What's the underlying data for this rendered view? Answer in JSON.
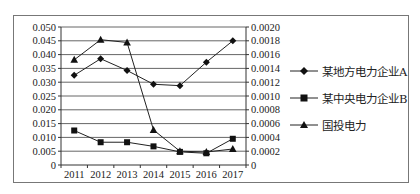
{
  "chart_data": {
    "type": "line",
    "title": "",
    "xlabel": "",
    "ylabel": "",
    "categories": [
      "2011",
      "2012",
      "2013",
      "2014",
      "2015",
      "2016",
      "2017"
    ],
    "left_axis": {
      "ylim": [
        0,
        0.05
      ],
      "ticks": [
        "0",
        "0.005",
        "0.010",
        "0.015",
        "0.020",
        "0.025",
        "0.030",
        "0.035",
        "0.040",
        "0.045",
        "0.050"
      ]
    },
    "right_axis": {
      "ylim": [
        0,
        0.002
      ],
      "ticks": [
        "0",
        "0.0002",
        "0.0004",
        "0.0006",
        "0.0008",
        "0.0010",
        "0.0012",
        "0.0014",
        "0.0016",
        "0.0018",
        "0.0020"
      ]
    },
    "grid": true,
    "legend_position": "right",
    "series": [
      {
        "name": "某地方电力企业A",
        "marker": "diamond",
        "axis": "right",
        "values": [
          0.0013,
          0.00154,
          0.00137,
          0.00117,
          0.00115,
          0.00149,
          0.0018
        ],
        "values_left_scale": [
          0.0323,
          0.0386,
          0.0343,
          0.0292,
          0.0287,
          0.0372,
          0.0449
        ]
      },
      {
        "name": "某中央电力企业B",
        "marker": "square",
        "axis": "right",
        "values": [
          0.0005,
          0.00033,
          0.00033,
          0.00027,
          0.00019,
          0.00017,
          0.00038
        ],
        "values_left_scale": [
          0.0123,
          0.0081,
          0.0081,
          0.0068,
          0.0047,
          0.0041,
          0.0094
        ]
      },
      {
        "name": "国投电力",
        "marker": "triangle",
        "axis": "left",
        "values": [
          0.0381,
          0.0454,
          0.0444,
          0.0127,
          0.005,
          0.0047,
          0.0058
        ]
      }
    ]
  },
  "legend": {
    "items": [
      {
        "label": "某地方电力企业A",
        "marker": "diamond-icon"
      },
      {
        "label": "某中央电力企业B",
        "marker": "square-icon"
      },
      {
        "label": "国投电力",
        "marker": "triangle-icon"
      }
    ]
  },
  "colors": {
    "line": "#222222",
    "grid": "#555555",
    "border": "#777777"
  }
}
